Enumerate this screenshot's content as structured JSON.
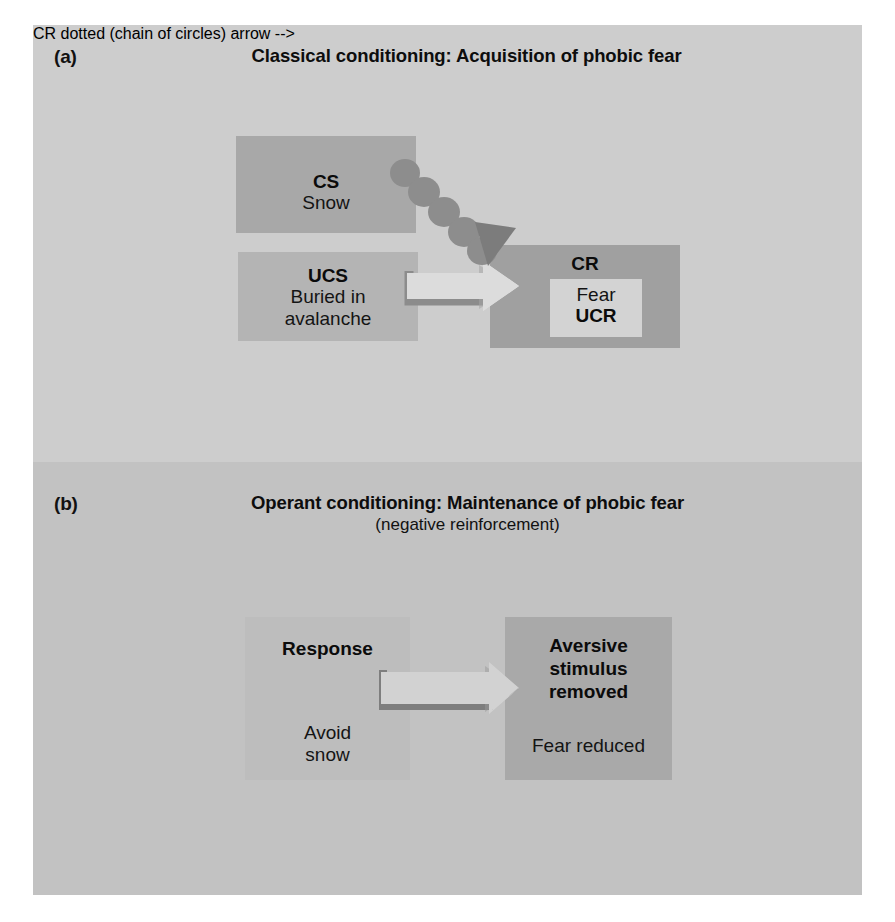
{
  "figure": {
    "background_color": "#c9c9c9"
  },
  "panels": {
    "a": {
      "letter": "(a)",
      "title": "Classical conditioning: Acquisition of phobic fear",
      "background_color": "#cdcdcd",
      "boxes": {
        "cs": {
          "label": "CS",
          "text": "Snow",
          "color": "#a8a8a8"
        },
        "ucs": {
          "label": "UCS",
          "text": "Buried in\navalanche",
          "line1": "Buried in",
          "line2": "avalanche",
          "color": "#b4b4b4"
        },
        "cr": {
          "label": "CR",
          "inner_line1": "Fear",
          "inner_line2": "UCR",
          "color": "#a0a0a0",
          "inner_color": "#d3d3d3"
        }
      },
      "arrows": {
        "dotted": {
          "name": "dotted-association-arrow",
          "from": "cs",
          "to": "cr",
          "color": "#8a8a8a"
        },
        "block": {
          "name": "ucs-to-cr-block-arrow",
          "from": "ucs",
          "to": "cr",
          "fill": "#dcdcdc",
          "outline": "#8c8c8c"
        }
      }
    },
    "b": {
      "letter": "(b)",
      "title": "Operant conditioning: Maintenance of phobic fear",
      "subtitle": "(negative reinforcement)",
      "background_color": "#c2c2c2",
      "boxes": {
        "response": {
          "label": "Response",
          "line1": "Avoid",
          "line2": "snow",
          "color": "#bdbdbd"
        },
        "aversive": {
          "label_line1": "Aversive",
          "label_line2": "stimulus",
          "label_line3": "removed",
          "text": "Fear reduced",
          "color": "#a9a9a9"
        }
      },
      "arrows": {
        "block": {
          "name": "response-to-aversive-block-arrow",
          "from": "response",
          "to": "aversive",
          "fill": "#d2d2d2",
          "outline": "#7e7e7e"
        }
      }
    }
  }
}
